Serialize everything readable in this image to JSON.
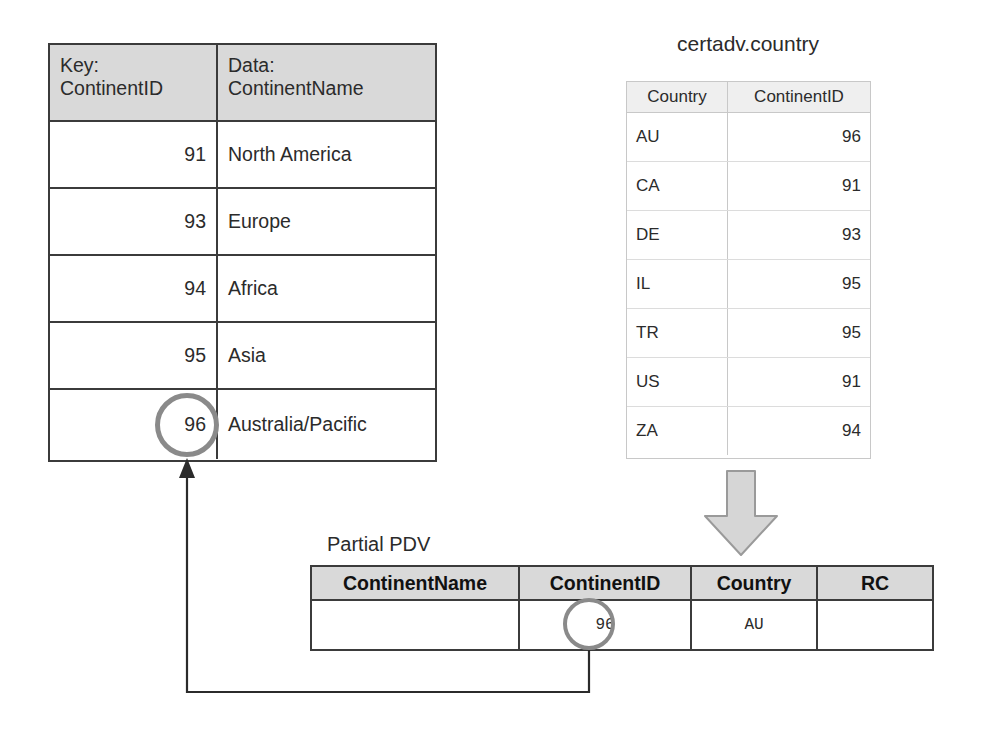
{
  "diagram": {
    "hash_table": {
      "name": "hash-object-table",
      "headers": {
        "key": "Key:\nContinentID",
        "data": "Data:\nContinentName"
      },
      "rows": [
        {
          "key": "91",
          "data": "North America"
        },
        {
          "key": "93",
          "data": "Europe"
        },
        {
          "key": "94",
          "data": "Africa"
        },
        {
          "key": "95",
          "data": "Asia"
        },
        {
          "key": "96",
          "data": "Australia/Pacific"
        }
      ],
      "highlighted_key": "96"
    },
    "country_table": {
      "title": "certadv.country",
      "headers": [
        "Country",
        "ContinentID"
      ],
      "rows": [
        {
          "country": "AU",
          "continent_id": "96"
        },
        {
          "country": "CA",
          "continent_id": "91"
        },
        {
          "country": "DE",
          "continent_id": "93"
        },
        {
          "country": "IL",
          "continent_id": "95"
        },
        {
          "country": "TR",
          "continent_id": "95"
        },
        {
          "country": "US",
          "continent_id": "91"
        },
        {
          "country": "ZA",
          "continent_id": "94"
        }
      ]
    },
    "pdv": {
      "label": "Partial PDV",
      "headers": [
        "ContinentName",
        "ContinentID",
        "Country",
        "RC"
      ],
      "row": {
        "continent_name": "",
        "continent_id": "96",
        "country": "AU",
        "rc": ""
      },
      "highlighted_value": "96"
    },
    "connectors": {
      "down_arrow": "down-block-arrow",
      "lookup_arrow": "pdv-to-hash-lookup-arrow"
    },
    "colors": {
      "header_fill": "#d9d9d9",
      "table_border": "#3b3b3b",
      "light_table_border": "#c8c8c8",
      "light_header_fill": "#efefef",
      "arrow_fill": "#d6d6d6",
      "arrow_stroke": "#9a9a9a",
      "highlight_circle": "#8a8a8a",
      "text": "#2b2b2b",
      "background": "#ffffff"
    }
  }
}
